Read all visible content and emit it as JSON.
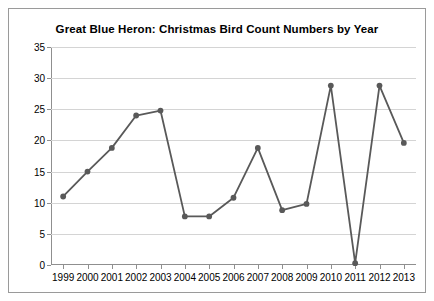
{
  "chart_data": {
    "type": "line",
    "title": "Great Blue Heron: Christmas Bird Count Numbers by Year",
    "xlabel": "",
    "ylabel": "",
    "categories": [
      "1999",
      "2000",
      "2001",
      "2002",
      "2003",
      "2004",
      "2005",
      "2006",
      "2007",
      "2008",
      "2009",
      "2010",
      "2011",
      "2012",
      "2013"
    ],
    "values": [
      11,
      15,
      18.8,
      24,
      24.8,
      7.8,
      7.8,
      10.8,
      18.8,
      8.8,
      9.8,
      28.8,
      0.3,
      28.8,
      19.6
    ],
    "ylim": [
      0,
      35
    ],
    "yticks": [
      0,
      5,
      10,
      15,
      20,
      25,
      30,
      35
    ],
    "grid": true,
    "legend": false,
    "series": [
      {
        "name": "Great Blue Heron",
        "values": [
          11,
          15,
          18.8,
          24,
          24.8,
          7.8,
          7.8,
          10.8,
          18.8,
          8.8,
          9.8,
          28.8,
          0.3,
          28.8,
          19.6
        ],
        "color": "#595959",
        "marker": "circle"
      }
    ],
    "colors": {
      "line": "#595959",
      "marker": "#595959",
      "grid": "#d4d4d4",
      "axis": "#8f8f8f",
      "text": "#000000",
      "background": "#ffffff",
      "border": "#9a9a9a"
    }
  }
}
